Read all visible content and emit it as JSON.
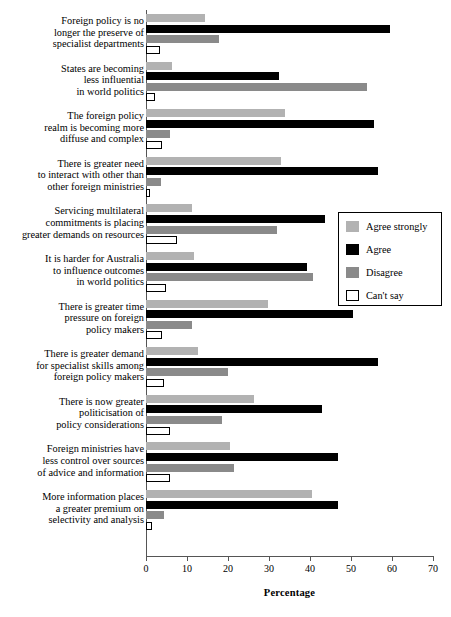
{
  "chart_data": {
    "type": "bar",
    "orientation": "horizontal",
    "title": "",
    "xlabel": "Percentage",
    "ylabel": "",
    "xlim": [
      0,
      70
    ],
    "xticks": [
      0,
      10,
      20,
      30,
      40,
      50,
      60,
      70
    ],
    "grid": false,
    "legend_position": "middle-right",
    "categories": [
      "Foreign policy is no longer the preserve of specialist departments",
      "States are becoming less influential in world politics",
      "The foreign policy realm is becoming more diffuse and complex",
      "There is greater need to interact with other than other foreign ministries",
      "Servicing multilateral commitments is placing greater demands on resources",
      "It is harder for Australia to influence outcomes in world politics",
      "There is greater time pressure on foreign policy makers",
      "There is greater demand for specialist skills among foreign policy makers",
      "There is now greater politicisation of policy considerations",
      "Foreign ministries have less control over sources of advice and information",
      "More information places a greater premium on selectivity and analysis"
    ],
    "category_lines": [
      [
        "Foreign policy is no",
        "longer the preserve of",
        "specialist departments"
      ],
      [
        "States are becoming",
        "less influential",
        "in world politics"
      ],
      [
        "The foreign policy",
        "realm is becoming more",
        "diffuse and complex"
      ],
      [
        "There is greater need",
        "to interact with other than",
        "other foreign ministries"
      ],
      [
        "Servicing multilateral",
        "commitments is placing",
        "greater demands on resources"
      ],
      [
        "It is harder for Australia",
        "to influence outcomes",
        "in world politics"
      ],
      [
        "There is greater time",
        "pressure on foreign",
        "policy makers"
      ],
      [
        "There is greater demand",
        "for specialist skills among",
        "foreign policy makers"
      ],
      [
        "There is now greater",
        "politicisation of",
        "policy considerations"
      ],
      [
        "Foreign ministries have",
        "less control over sources",
        "of advice and information"
      ],
      [
        "More information places",
        "a greater premium on",
        "selectivity and analysis"
      ]
    ],
    "series": [
      {
        "name": "Agree strongly",
        "color": "#b2b2b2",
        "values": [
          14.5,
          6.3,
          34.0,
          33.0,
          11.2,
          11.7,
          29.8,
          12.7,
          26.3,
          20.5,
          40.5
        ]
      },
      {
        "name": "Agree",
        "color": "#000000",
        "values": [
          59.5,
          32.4,
          55.6,
          56.6,
          43.7,
          39.3,
          50.5,
          56.6,
          42.9,
          46.8,
          46.8
        ]
      },
      {
        "name": "Disagree",
        "color": "#8a8a8a",
        "values": [
          17.8,
          54.0,
          5.9,
          3.7,
          32.0,
          40.7,
          11.2,
          20.0,
          18.5,
          21.5,
          4.4
        ]
      },
      {
        "name": "Can't say",
        "color": "#ffffff",
        "values": [
          3.5,
          2.2,
          4.0,
          1.0,
          7.5,
          4.9,
          4.0,
          4.4,
          5.9,
          5.9,
          1.5
        ]
      }
    ]
  },
  "legend": {
    "items": [
      {
        "label": "Agree strongly",
        "swatch": "agree-strongly"
      },
      {
        "label": "Agree",
        "swatch": "agree"
      },
      {
        "label": "Disagree",
        "swatch": "disagree"
      },
      {
        "label": "Can't say",
        "swatch": "cant-say"
      }
    ]
  },
  "axis": {
    "x_title": "Percentage",
    "tick_labels": [
      "0",
      "10",
      "20",
      "30",
      "40",
      "50",
      "60",
      "70"
    ]
  }
}
